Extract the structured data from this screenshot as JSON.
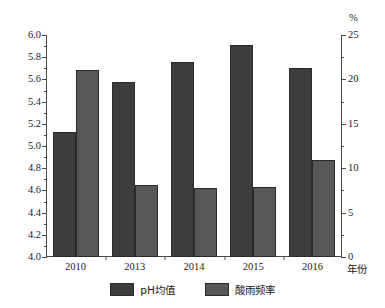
{
  "chart_data": {
    "type": "bar",
    "title": "",
    "xlabel": "年份",
    "categories": [
      "2010",
      "2013",
      "2014",
      "2015",
      "2016"
    ],
    "grid": false,
    "legend_position": "bottom",
    "series": [
      {
        "name": "pH均值",
        "axis": "left",
        "color": "#3d3d3d",
        "values": [
          5.13,
          5.58,
          5.76,
          5.91,
          5.7
        ]
      },
      {
        "name": "酸雨频率",
        "axis": "right",
        "color": "#575757",
        "values": [
          21.1,
          8.1,
          7.8,
          7.9,
          10.9
        ]
      }
    ],
    "left_axis": {
      "label": "",
      "unit": "",
      "min": 4.0,
      "max": 6.0,
      "step": 0.2,
      "ticks": [
        "4.0",
        "4.2",
        "4.4",
        "4.6",
        "4.8",
        "5.0",
        "5.2",
        "5.4",
        "5.6",
        "5.8",
        "6.0"
      ]
    },
    "right_axis": {
      "label": "",
      "unit": "%",
      "min": 0,
      "max": 25,
      "step": 5,
      "ticks": [
        "0",
        "5",
        "10",
        "15",
        "20",
        "25"
      ]
    }
  }
}
